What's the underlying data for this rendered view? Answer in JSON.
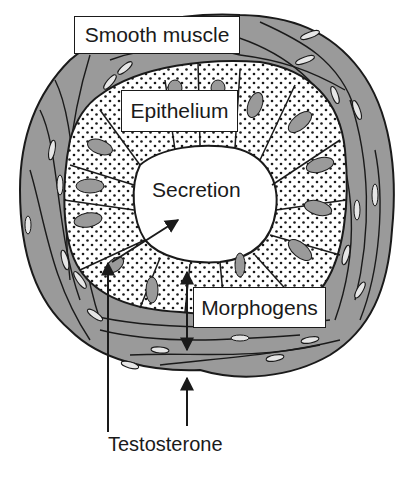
{
  "diagram": {
    "labels": {
      "smooth_muscle": "Smooth muscle",
      "epithelium": "Epithelium",
      "secretion": "Secretion",
      "morphogens": "Morphogens",
      "testosterone": "Testosterone"
    },
    "colors": {
      "muscle_fill": "#9a9a9a",
      "muscle_nucleus": "#e6e6e6",
      "epithelium_fill": "#ffffff",
      "epithelium_dots": "#1a1a1a",
      "epithelial_nucleus": "#9a9a9a",
      "outline": "#1a1a1a"
    },
    "arrows": [
      {
        "from": "testosterone",
        "to": "epithelium",
        "direction": "up"
      },
      {
        "from": "testosterone",
        "to": "smooth_muscle",
        "direction": "up"
      },
      {
        "from": "epithelium",
        "to": "secretion",
        "direction": "up-right"
      },
      {
        "between": [
          "smooth_muscle",
          "epithelium"
        ],
        "label": "morphogens",
        "direction": "bidirectional"
      }
    ]
  }
}
